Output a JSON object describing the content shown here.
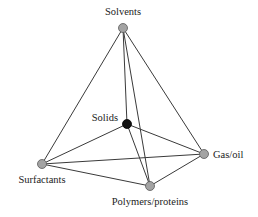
{
  "diagram": {
    "title": "",
    "nodes": [
      {
        "id": "solvents",
        "label": "Solvents",
        "x": 123,
        "y": 28,
        "r": 4.5,
        "type": "vertex",
        "label_x": 123,
        "label_y": 15,
        "anchor": "middle"
      },
      {
        "id": "solids",
        "label": "Solids",
        "x": 127,
        "y": 124,
        "r": 4.5,
        "type": "center",
        "label_x": 118,
        "label_y": 121,
        "anchor": "end"
      },
      {
        "id": "gas_oil",
        "label": "Gas/oil",
        "x": 204,
        "y": 154,
        "r": 4.5,
        "type": "vertex",
        "label_x": 213,
        "label_y": 158,
        "anchor": "start"
      },
      {
        "id": "surfactants",
        "label": "Surfactants",
        "x": 42,
        "y": 164,
        "r": 4.5,
        "type": "vertex",
        "label_x": 42,
        "label_y": 183,
        "anchor": "middle"
      },
      {
        "id": "polymers_proteins",
        "label": "Polymers/proteins",
        "x": 150,
        "y": 186,
        "r": 4.5,
        "type": "vertex",
        "label_x": 150,
        "label_y": 205,
        "anchor": "middle"
      }
    ],
    "edges": [
      {
        "from": "solvents",
        "to": "surfactants"
      },
      {
        "from": "solvents",
        "to": "gas_oil"
      },
      {
        "from": "solvents",
        "to": "solids"
      },
      {
        "from": "solvents",
        "to": "polymers_proteins"
      },
      {
        "from": "solids",
        "to": "surfactants"
      },
      {
        "from": "solids",
        "to": "gas_oil"
      },
      {
        "from": "solids",
        "to": "polymers_proteins"
      },
      {
        "from": "surfactants",
        "to": "gas_oil"
      },
      {
        "from": "surfactants",
        "to": "polymers_proteins"
      },
      {
        "from": "polymers_proteins",
        "to": "gas_oil"
      }
    ],
    "colors": {
      "edge": "#3a3a3a",
      "vertex_fill": "#a3a3a3",
      "vertex_stroke": "#5a5a5a",
      "center_fill": "#111111",
      "label": "#222222"
    }
  }
}
